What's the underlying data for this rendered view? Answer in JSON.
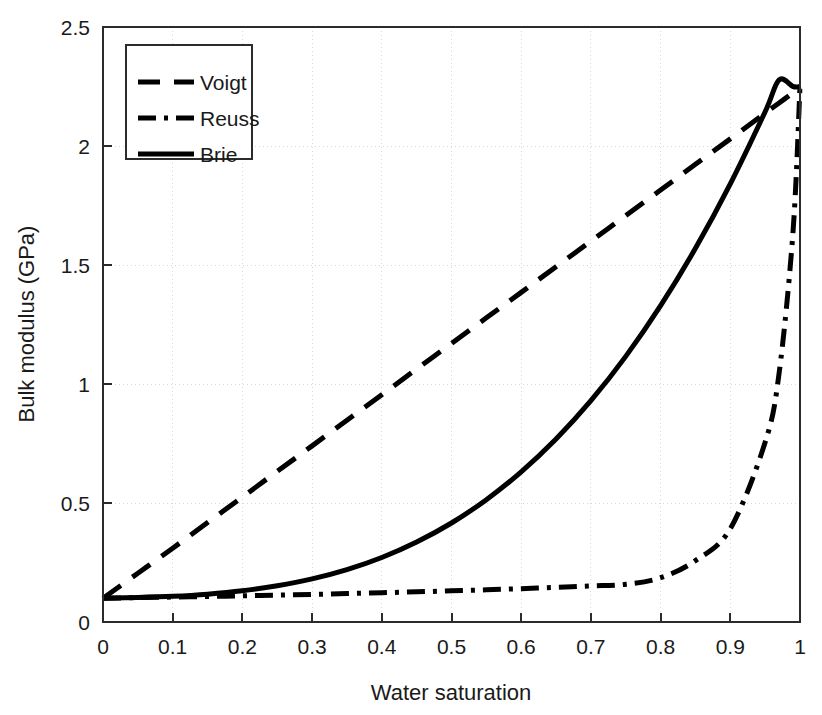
{
  "chart_data": {
    "type": "line",
    "title": "",
    "xlabel": "Water saturation",
    "ylabel": "Bulk modulus (GPa)",
    "xlim": [
      0,
      1
    ],
    "ylim": [
      0,
      2.5
    ],
    "xticks": [
      "0",
      "0.1",
      "0.2",
      "0.3",
      "0.4",
      "0.5",
      "0.6",
      "0.7",
      "0.8",
      "0.9",
      "1"
    ],
    "xtick_values": [
      0,
      0.1,
      0.2,
      0.3,
      0.4,
      0.5,
      0.6,
      0.7,
      0.8,
      0.9,
      1
    ],
    "yticks": [
      "0",
      "0.5",
      "1",
      "1.5",
      "2",
      "2.5"
    ],
    "ytick_values": [
      0,
      0.5,
      1,
      1.5,
      2,
      2.5
    ],
    "grid": true,
    "legend_position": "upper-left-inside",
    "x": [
      0,
      0.05,
      0.1,
      0.15,
      0.2,
      0.25,
      0.3,
      0.35,
      0.4,
      0.45,
      0.5,
      0.55,
      0.6,
      0.65,
      0.7,
      0.75,
      0.8,
      0.85,
      0.9,
      0.95,
      0.97,
      0.99,
      1
    ],
    "series": [
      {
        "name": "Voigt",
        "style": "dashed",
        "color": "#000000",
        "values": [
          0.1,
          0.205,
          0.31,
          0.418,
          0.525,
          0.633,
          0.74,
          0.848,
          0.955,
          1.063,
          1.17,
          1.278,
          1.385,
          1.493,
          1.6,
          1.708,
          1.815,
          1.923,
          2.03,
          2.138,
          2.181,
          2.224,
          2.25
        ]
      },
      {
        "name": "Reuss",
        "style": "dash-dot",
        "color": "#000000",
        "values": [
          0.1,
          0.1023,
          0.1048,
          0.1074,
          0.1101,
          0.113,
          0.1161,
          0.1194,
          0.1229,
          0.1267,
          0.1308,
          0.1353,
          0.1402,
          0.1456,
          0.1516,
          0.1583,
          0.186,
          0.258,
          0.392,
          0.755,
          1.045,
          1.64,
          2.25
        ]
      },
      {
        "name": "Brie",
        "style": "solid",
        "color": "#000000",
        "values": [
          0.1,
          0.103,
          0.108,
          0.117,
          0.131,
          0.152,
          0.181,
          0.22,
          0.271,
          0.336,
          0.416,
          0.514,
          0.631,
          0.769,
          0.93,
          1.116,
          1.329,
          1.57,
          1.841,
          2.144,
          2.278,
          2.25,
          2.25
        ]
      }
    ]
  },
  "legend": {
    "entries": [
      {
        "label": "Voigt",
        "style": "dashed"
      },
      {
        "label": "Reuss",
        "style": "dash-dot"
      },
      {
        "label": "Brie",
        "style": "solid"
      }
    ]
  },
  "axes": {
    "x_title": "Water saturation",
    "y_title": "Bulk modulus (GPa)"
  }
}
